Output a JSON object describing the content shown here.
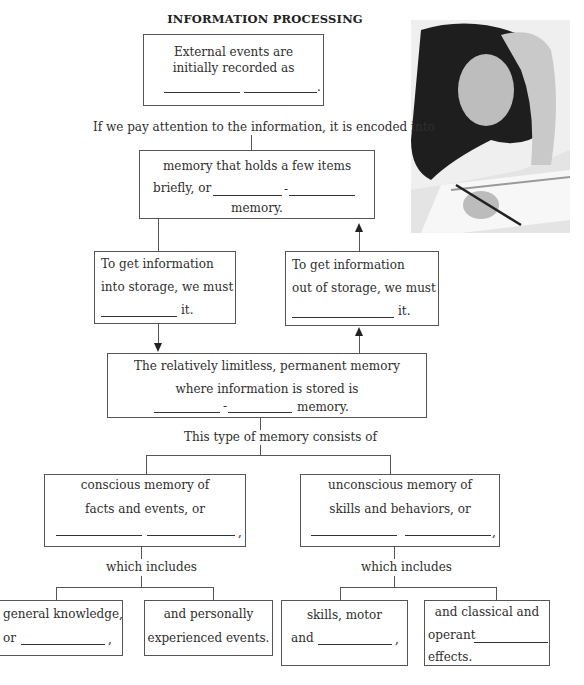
{
  "title": "INFORMATION PROCESSING",
  "photo": {
    "description": "student-studying-photo"
  },
  "sensory_box": {
    "line1": "External events are",
    "line2": "initially recorded as",
    "end": "."
  },
  "connector1": "If we pay attention to the information, it is encoded into",
  "stm_box": {
    "line1": "memory that holds a few items",
    "line2_prefix": "briefly, or",
    "hyphen": "-",
    "line3": "memory."
  },
  "encode_box": {
    "line1": "To get information",
    "line2": "into storage, we must",
    "end": "it."
  },
  "retrieve_box": {
    "line1": "To get information",
    "line2": "out of storage, we must",
    "end": "it."
  },
  "ltm_box": {
    "line1": "The relatively limitless, permanent memory",
    "line2": "where information is stored is",
    "hyphen": "-",
    "end": "memory."
  },
  "connector2": "This type of memory consists of",
  "explicit_box": {
    "line1": "conscious memory of",
    "line2": "facts and events, or",
    "end": ","
  },
  "implicit_box": {
    "line1": "unconscious memory of",
    "line2": "skills and behaviors, or",
    "end": ","
  },
  "includes_left": "which includes",
  "includes_right": "which includes",
  "semantic_box": {
    "line1": "general knowledge,",
    "line2_prefix": "or",
    "end": ","
  },
  "episodic_box": {
    "line1": "and personally",
    "line2": "experienced events."
  },
  "procedural_box": {
    "line1": "skills, motor",
    "line2_prefix": "and",
    "end": ","
  },
  "conditioning_box": {
    "line1": "and classical  and",
    "line2_prefix": "operant",
    "line3": "effects."
  }
}
